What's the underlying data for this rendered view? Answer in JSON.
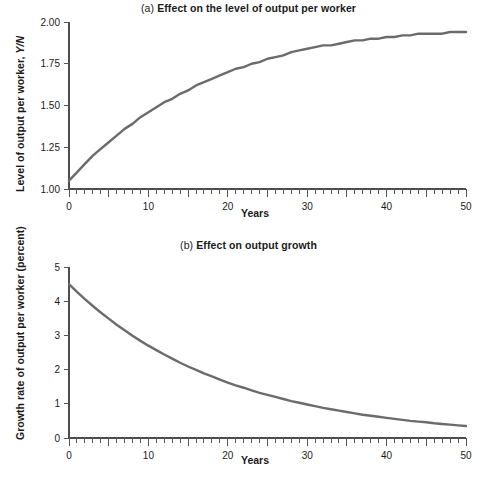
{
  "figure": {
    "background": "#ffffff",
    "width": 497,
    "height": 483
  },
  "panel_a": {
    "tag": "(a)",
    "title": "Effect on the level of output per worker",
    "ylabel_main": "Level of output per worker, ",
    "ylabel_italic": "Y/N",
    "xlabel": "Years",
    "y_ticks": [
      "1.00",
      "1.25",
      "1.50",
      "1.75",
      "2.00"
    ],
    "x_ticks": [
      "0",
      "10",
      "20",
      "30",
      "40",
      "50"
    ]
  },
  "panel_b": {
    "tag": "(b)",
    "title": "Effect on output growth",
    "ylabel_main": "Growth rate of output per worker (percent)",
    "xlabel": "Years",
    "y_ticks": [
      "0",
      "1",
      "2",
      "3",
      "4",
      "5"
    ],
    "x_ticks": [
      "0",
      "10",
      "20",
      "30",
      "40",
      "50"
    ]
  },
  "chart_data": [
    {
      "id": "panel-a",
      "type": "line",
      "title": "(a) Effect on the level of output per worker",
      "xlabel": "Years",
      "ylabel": "Level of output per worker, Y/N",
      "xlim": [
        0,
        50
      ],
      "ylim": [
        1.0,
        2.0
      ],
      "xticks": [
        0,
        10,
        20,
        30,
        40,
        50
      ],
      "yticks": [
        1.0,
        1.25,
        1.5,
        1.75,
        2.0
      ],
      "xminor_step": 1,
      "grid": false,
      "legend": "none",
      "line_color": "#6b6b6b",
      "line_width": 2.4,
      "series": [
        {
          "name": "Level of output per worker",
          "x": [
            0,
            1,
            2,
            3,
            4,
            5,
            6,
            7,
            8,
            9,
            10,
            11,
            12,
            13,
            14,
            15,
            16,
            17,
            18,
            19,
            20,
            21,
            22,
            23,
            24,
            25,
            26,
            27,
            28,
            29,
            30,
            31,
            32,
            33,
            34,
            35,
            36,
            37,
            38,
            39,
            40,
            41,
            42,
            43,
            44,
            45,
            46,
            47,
            48,
            49,
            50
          ],
          "values": [
            1.05,
            1.1,
            1.15,
            1.2,
            1.24,
            1.28,
            1.32,
            1.36,
            1.39,
            1.43,
            1.46,
            1.49,
            1.52,
            1.54,
            1.57,
            1.59,
            1.62,
            1.64,
            1.66,
            1.68,
            1.7,
            1.72,
            1.73,
            1.75,
            1.76,
            1.78,
            1.79,
            1.8,
            1.82,
            1.83,
            1.84,
            1.85,
            1.86,
            1.86,
            1.87,
            1.88,
            1.89,
            1.89,
            1.9,
            1.9,
            1.91,
            1.91,
            1.92,
            1.92,
            1.93,
            1.93,
            1.93,
            1.93,
            1.94,
            1.94,
            1.94
          ]
        }
      ]
    },
    {
      "id": "panel-b",
      "type": "line",
      "title": "(b) Effect on output growth",
      "xlabel": "Years",
      "ylabel": "Growth rate of output per worker (percent)",
      "xlim": [
        0,
        50
      ],
      "ylim": [
        0,
        5
      ],
      "xticks": [
        0,
        10,
        20,
        30,
        40,
        50
      ],
      "yticks": [
        0,
        1,
        2,
        3,
        4,
        5
      ],
      "xminor_step": 1,
      "grid": false,
      "legend": "none",
      "line_color": "#6b6b6b",
      "line_width": 2.4,
      "series": [
        {
          "name": "Growth rate of output per worker",
          "x": [
            0,
            1,
            2,
            3,
            4,
            5,
            6,
            7,
            8,
            9,
            10,
            11,
            12,
            13,
            14,
            15,
            16,
            17,
            18,
            19,
            20,
            21,
            22,
            23,
            24,
            25,
            26,
            27,
            28,
            29,
            30,
            31,
            32,
            33,
            34,
            35,
            36,
            37,
            38,
            39,
            40,
            41,
            42,
            43,
            44,
            45,
            46,
            47,
            48,
            49,
            50
          ],
          "values": [
            4.5,
            4.27,
            4.06,
            3.86,
            3.67,
            3.49,
            3.31,
            3.15,
            2.99,
            2.84,
            2.7,
            2.57,
            2.44,
            2.32,
            2.2,
            2.09,
            1.99,
            1.89,
            1.8,
            1.71,
            1.62,
            1.54,
            1.47,
            1.39,
            1.32,
            1.26,
            1.2,
            1.14,
            1.08,
            1.03,
            0.98,
            0.93,
            0.88,
            0.84,
            0.8,
            0.76,
            0.72,
            0.68,
            0.65,
            0.62,
            0.59,
            0.56,
            0.53,
            0.5,
            0.48,
            0.46,
            0.43,
            0.41,
            0.39,
            0.37,
            0.35
          ]
        }
      ]
    }
  ]
}
